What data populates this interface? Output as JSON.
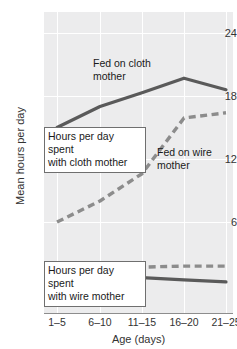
{
  "chart_data": {
    "type": "line",
    "title": "",
    "xlabel": "Age (days)",
    "ylabel": "Mean hours per day",
    "categories": [
      "1–5",
      "6–10",
      "11–15",
      "16–20",
      "21–25"
    ],
    "ylim": [
      0,
      25.8
    ],
    "yticks": [
      6,
      12,
      18,
      24
    ],
    "grid": true,
    "legend": "annotations-inline",
    "series": [
      {
        "name": "Hours per day spent with cloth mother (fed on cloth mother)",
        "style": "solid",
        "color": "#5a5a5a",
        "values": [
          15.0,
          17.0,
          18.3,
          19.7,
          18.6
        ]
      },
      {
        "name": "Hours per day spent with cloth mother (fed on wire mother)",
        "style": "dashed",
        "color": "#8c8c8c",
        "values": [
          6.0,
          8.0,
          10.6,
          15.9,
          16.4
        ]
      },
      {
        "name": "Hours per day spent with wire mother (fed on wire mother)",
        "style": "dashed",
        "color": "#8c8c8c",
        "values": [
          1.8,
          1.4,
          1.7,
          1.8,
          1.8
        ]
      },
      {
        "name": "Hours per day spent with wire mother (fed on cloth mother)",
        "style": "solid",
        "color": "#5a5a5a",
        "values": [
          0.8,
          0.1,
          0.7,
          0.5,
          0.3
        ]
      }
    ],
    "annotations": [
      {
        "id": "fed-on-cloth",
        "text_line1": "Fed on cloth",
        "text_line2": "mother",
        "boxed": false
      },
      {
        "id": "fed-on-wire",
        "text_line1": "Fed on wire",
        "text_line2": "mother",
        "boxed": false
      },
      {
        "id": "cloth-group",
        "text_line1": "Hours per day spent",
        "text_line2": "with cloth mother",
        "boxed": true
      },
      {
        "id": "wire-group",
        "text_line1": "Hours per day spent",
        "text_line2": "with wire mother",
        "boxed": true
      }
    ]
  },
  "ticks": {
    "y": {
      "t0": "24",
      "t1": "18",
      "t2": "12",
      "t3": "6"
    },
    "x": {
      "x0": "1–5",
      "x1": "6–10",
      "x2": "11–15",
      "x3": "16–20",
      "x4": "21–25"
    }
  },
  "axes": {
    "x_title": "Age (days)",
    "y_title": "Mean hours per day"
  },
  "annotations": {
    "fed_cloth_l1": "Fed on cloth",
    "fed_cloth_l2": "mother",
    "fed_wire_l1": "Fed on wire",
    "fed_wire_l2": "mother",
    "cloth_box_l1": "Hours per day spent",
    "cloth_box_l2": "with cloth mother",
    "wire_box_l1": "Hours per day spent",
    "wire_box_l2": "with wire mother"
  },
  "colors": {
    "plot_background": "#ececed",
    "gridline": "#ffffff",
    "axis": "#8d8d8d",
    "solid_series": "#5a5a5a",
    "dashed_series": "#8c8c8c",
    "box_border": "#6f6f6f",
    "text": "#1a1a1a"
  }
}
